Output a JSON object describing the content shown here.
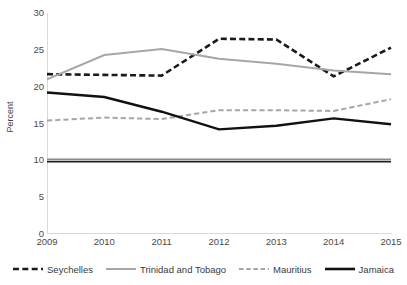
{
  "chart_data": {
    "type": "line",
    "title": "",
    "xlabel": "",
    "ylabel": "Percent",
    "x": [
      "2009",
      "2010",
      "2011",
      "2012",
      "2013",
      "2014",
      "2015"
    ],
    "categories": [
      "2009",
      "2010",
      "2011",
      "2012",
      "2013",
      "2014",
      "2015"
    ],
    "ylim": [
      0,
      30
    ],
    "yticks": [
      0,
      5,
      10,
      15,
      20,
      25,
      30
    ],
    "ytick_labels": [
      "0",
      "5",
      "10",
      "15",
      "20",
      "25",
      "30"
    ],
    "grid": false,
    "legend_position": "bottom",
    "series": [
      {
        "name": "Seychelles",
        "values": [
          21.7,
          21.6,
          21.5,
          26.5,
          26.4,
          21.4,
          25.3
        ],
        "color": "#1a1a1a",
        "style": "dashed",
        "width": 2.6
      },
      {
        "name": "Trinidad and Tobago",
        "values": [
          21.0,
          24.3,
          25.1,
          23.8,
          23.1,
          22.2,
          21.7
        ],
        "color": "#a6a6a6",
        "style": "solid",
        "width": 2.0
      },
      {
        "name": "Mauritius",
        "values": [
          15.4,
          15.8,
          15.6,
          16.8,
          16.8,
          16.7,
          18.3
        ],
        "color": "#a6a6a6",
        "style": "dashed",
        "width": 2.0
      },
      {
        "name": "Jamaica",
        "values": [
          19.2,
          18.6,
          16.6,
          14.2,
          14.7,
          15.7,
          14.9
        ],
        "color": "#111111",
        "style": "solid",
        "width": 2.4
      },
      {
        "name": "reference-gray",
        "values": [
          10.1,
          10.1,
          10.1,
          10.1,
          10.1,
          10.1,
          10.1
        ],
        "color": "#8c8c8c",
        "style": "solid",
        "width": 2.0
      },
      {
        "name": "reference-black",
        "values": [
          9.8,
          9.8,
          9.8,
          9.8,
          9.8,
          9.8,
          9.8
        ],
        "color": "#1f1f1f",
        "style": "solid",
        "width": 1.4
      }
    ],
    "legend_entries": [
      {
        "label": "Seychelles",
        "color": "#1a1a1a",
        "style": "dashed"
      },
      {
        "label": "Trinidad and Tobago",
        "color": "#a6a6a6",
        "style": "solid"
      },
      {
        "label": "Mauritius",
        "color": "#a6a6a6",
        "style": "dashed"
      },
      {
        "label": "Jamaica",
        "color": "#111111",
        "style": "solid"
      }
    ],
    "axis_color": "#d9d9d9"
  }
}
